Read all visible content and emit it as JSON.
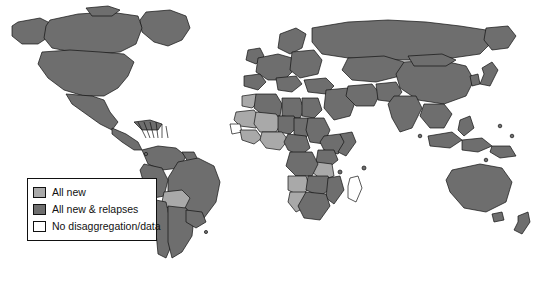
{
  "figure": {
    "type": "choropleth-world-map",
    "background_color": "#ffffff",
    "outline_color": "#111111"
  },
  "legend": {
    "name": "map-legend",
    "items": [
      {
        "label": "All new",
        "color": "#a9a9a9",
        "icon": "legend-swatch-all-new"
      },
      {
        "label": "All new & relapses",
        "color": "#6e6e6e",
        "icon": "legend-swatch-all-new-relapses"
      },
      {
        "label": "No disaggregation/data",
        "color": "#ffffff",
        "icon": "legend-swatch-no-data"
      }
    ]
  },
  "map_data": {
    "categories": [
      "All new",
      "All new & relapses",
      "No disaggregation/data"
    ],
    "colors": {
      "All new": "#a9a9a9",
      "All new & relapses": "#6e6e6e",
      "No disaggregation/data": "#ffffff"
    },
    "regions": [
      {
        "name": "canada",
        "category": "All new & relapses"
      },
      {
        "name": "alaska",
        "category": "All new & relapses"
      },
      {
        "name": "united-states",
        "category": "All new & relapses"
      },
      {
        "name": "greenland",
        "category": "All new & relapses"
      },
      {
        "name": "mexico",
        "category": "All new & relapses"
      },
      {
        "name": "central-america",
        "category": "All new & relapses"
      },
      {
        "name": "caribbean-islands",
        "category": "All new & relapses"
      },
      {
        "name": "colombia",
        "category": "All new & relapses"
      },
      {
        "name": "venezuela",
        "category": "All new & relapses"
      },
      {
        "name": "guyanas",
        "category": "All new & relapses"
      },
      {
        "name": "brazil",
        "category": "All new & relapses"
      },
      {
        "name": "peru",
        "category": "All new & relapses"
      },
      {
        "name": "bolivia",
        "category": "All new"
      },
      {
        "name": "chile",
        "category": "All new & relapses"
      },
      {
        "name": "argentina",
        "category": "All new & relapses"
      },
      {
        "name": "paraguay",
        "category": "All new & relapses"
      },
      {
        "name": "uruguay",
        "category": "All new & relapses"
      },
      {
        "name": "ecuador",
        "category": "All new & relapses"
      },
      {
        "name": "morocco",
        "category": "All new"
      },
      {
        "name": "algeria",
        "category": "All new & relapses"
      },
      {
        "name": "libya",
        "category": "All new & relapses"
      },
      {
        "name": "egypt",
        "category": "All new & relapses"
      },
      {
        "name": "mauritania",
        "category": "All new"
      },
      {
        "name": "mali",
        "category": "All new"
      },
      {
        "name": "niger",
        "category": "All new & relapses"
      },
      {
        "name": "chad",
        "category": "All new & relapses"
      },
      {
        "name": "sudan",
        "category": "All new & relapses"
      },
      {
        "name": "senegal",
        "category": "No disaggregation/data"
      },
      {
        "name": "guinea",
        "category": "All new"
      },
      {
        "name": "nigeria",
        "category": "All new"
      },
      {
        "name": "cameroon",
        "category": "All new & relapses"
      },
      {
        "name": "ethiopia",
        "category": "All new & relapses"
      },
      {
        "name": "somalia",
        "category": "All new & relapses"
      },
      {
        "name": "kenya",
        "category": "All new & relapses"
      },
      {
        "name": "tanzania",
        "category": "All new"
      },
      {
        "name": "dr-congo",
        "category": "All new & relapses"
      },
      {
        "name": "angola",
        "category": "All new"
      },
      {
        "name": "zambia",
        "category": "All new & relapses"
      },
      {
        "name": "mozambique",
        "category": "All new & relapses"
      },
      {
        "name": "namibia",
        "category": "All new"
      },
      {
        "name": "botswana",
        "category": "All new & relapses"
      },
      {
        "name": "south-africa",
        "category": "All new & relapses"
      },
      {
        "name": "madagascar",
        "category": "No disaggregation/data"
      },
      {
        "name": "europe",
        "category": "All new & relapses"
      },
      {
        "name": "russia",
        "category": "All new & relapses"
      },
      {
        "name": "turkey",
        "category": "All new & relapses"
      },
      {
        "name": "middle-east",
        "category": "All new & relapses"
      },
      {
        "name": "saudi-arabia",
        "category": "All new & relapses"
      },
      {
        "name": "iran",
        "category": "All new & relapses"
      },
      {
        "name": "kazakhstan",
        "category": "All new & relapses"
      },
      {
        "name": "china",
        "category": "All new & relapses"
      },
      {
        "name": "mongolia",
        "category": "All new & relapses"
      },
      {
        "name": "india",
        "category": "All new & relapses"
      },
      {
        "name": "pakistan",
        "category": "All new & relapses"
      },
      {
        "name": "southeast-asia",
        "category": "All new & relapses"
      },
      {
        "name": "indonesia",
        "category": "All new & relapses"
      },
      {
        "name": "philippines",
        "category": "All new & relapses"
      },
      {
        "name": "japan",
        "category": "All new & relapses"
      },
      {
        "name": "australia",
        "category": "All new & relapses"
      },
      {
        "name": "new-zealand",
        "category": "All new & relapses"
      },
      {
        "name": "papua-new-guinea",
        "category": "All new & relapses"
      }
    ]
  }
}
